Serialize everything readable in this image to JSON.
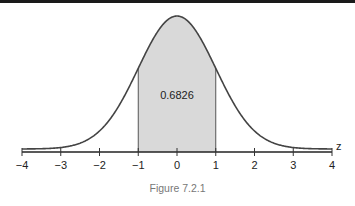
{
  "chart_data": {
    "type": "area",
    "title": "",
    "caption": "Figure 7.2.1",
    "xlabel": "z",
    "ylabel": "",
    "xlim": [
      -4,
      4
    ],
    "x_ticks": [
      -4,
      -3,
      -2,
      -1,
      0,
      1,
      2,
      3,
      4
    ],
    "x_tick_labels": [
      "−4",
      "−3",
      "−2",
      "−1",
      "0",
      "1",
      "2",
      "3",
      "4"
    ],
    "curve": "standard normal density",
    "shaded_region": {
      "from": -1,
      "to": 1
    },
    "annotations": [
      {
        "text": "0.6826",
        "x": 0,
        "note": "area between z = -1 and z = 1"
      }
    ],
    "grid": false,
    "colors": {
      "curve": "#444444",
      "shade": "#d9d9d9",
      "axis": "#222222"
    }
  }
}
